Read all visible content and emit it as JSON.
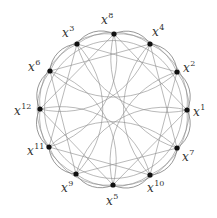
{
  "diagram": {
    "title": "",
    "center": [
      113.5,
      109.5
    ],
    "radius": 75,
    "edge_color": "#8a8a8a",
    "node_color": "#111111",
    "nodes": [
      {
        "id": "x8",
        "base": "x",
        "exp": "8",
        "pos": [
          114,
          34
        ],
        "label_pos": [
          101,
          12
        ]
      },
      {
        "id": "x4",
        "base": "x",
        "exp": "4",
        "pos": [
          150,
          44
        ],
        "label_pos": [
          152,
          24
        ]
      },
      {
        "id": "x2",
        "base": "x",
        "exp": "2",
        "pos": [
          177,
          72
        ],
        "label_pos": [
          183,
          60
        ]
      },
      {
        "id": "x1",
        "base": "x",
        "exp": "1",
        "pos": [
          187,
          110
        ],
        "label_pos": [
          193,
          104
        ]
      },
      {
        "id": "x7",
        "base": "x",
        "exp": "7",
        "pos": [
          177,
          148
        ],
        "label_pos": [
          182,
          149
        ]
      },
      {
        "id": "x10",
        "base": "x",
        "exp": "10",
        "pos": [
          150,
          175
        ],
        "label_pos": [
          147,
          180
        ]
      },
      {
        "id": "x5",
        "base": "x",
        "exp": "5",
        "pos": [
          113,
          185
        ],
        "label_pos": [
          106,
          193
        ]
      },
      {
        "id": "x9",
        "base": "x",
        "exp": "9",
        "pos": [
          76,
          174
        ],
        "label_pos": [
          61,
          180
        ]
      },
      {
        "id": "x11",
        "base": "x",
        "exp": "11",
        "pos": [
          49,
          147
        ],
        "label_pos": [
          27,
          143
        ]
      },
      {
        "id": "x12",
        "base": "x",
        "exp": "12",
        "pos": [
          40,
          109
        ],
        "label_pos": [
          14,
          103
        ]
      },
      {
        "id": "x6",
        "base": "x",
        "exp": "6",
        "pos": [
          50,
          71
        ],
        "label_pos": [
          28,
          59
        ]
      },
      {
        "id": "x3",
        "base": "x",
        "exp": "3",
        "pos": [
          77,
          44
        ],
        "label_pos": [
          62,
          25
        ]
      }
    ]
  }
}
